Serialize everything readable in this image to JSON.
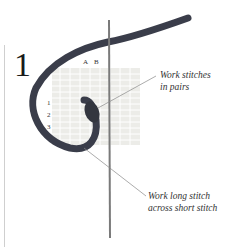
{
  "figure": {
    "step_number": "1",
    "column_labels": [
      "A",
      "B"
    ],
    "row_labels": [
      "1",
      "2",
      "3"
    ],
    "callouts": [
      {
        "line1": "Work stitches",
        "line2": "in pairs"
      },
      {
        "line1": "Work long stitch",
        "line2": "across short stitch"
      }
    ],
    "colors": {
      "yarn": "#3a3d4a",
      "canvas": "#e6e6e0",
      "needle": "#777777"
    }
  }
}
